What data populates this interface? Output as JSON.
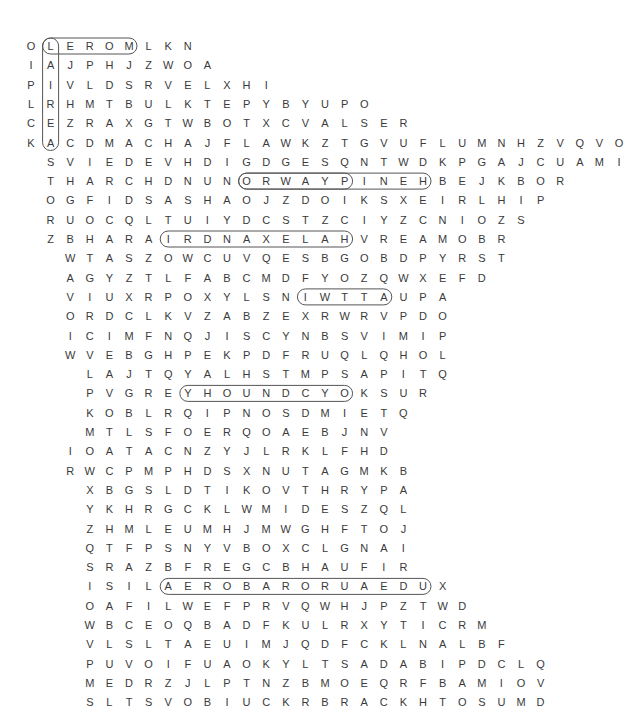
{
  "puzzle": {
    "grid_origin": {
      "x": 31,
      "y": 46
    },
    "cell_w": 19.6,
    "row_h": 19.3,
    "rows": [
      {
        "offset": 0,
        "letters": "OLEROMLKN"
      },
      {
        "offset": 0,
        "letters": "IAJPHJZWOA"
      },
      {
        "offset": 0,
        "letters": "PIVLDSRVELXHI"
      },
      {
        "offset": 0,
        "letters": "LRHMTBULKTEPYBYUPO"
      },
      {
        "offset": 0,
        "letters": "CEZRAXGTWBOTXCVALSER"
      },
      {
        "offset": 0,
        "letters": "KACDMACHAJFLAWKZTGVUFLUMNHZVQVO"
      },
      {
        "offset": 1,
        "letters": "SVIEDEVHDIGDGESQNTWDKPGAJCUAMI"
      },
      {
        "offset": 1,
        "letters": "THARCHDNUNORWAYPINEHBEJKBOR"
      },
      {
        "offset": 1,
        "letters": "OGFIDSASHAOJZDOIKSXEIRLHIP"
      },
      {
        "offset": 1,
        "letters": "RUOCQLTUIYDCSTZCIYZCNIOZS"
      },
      {
        "offset": 1,
        "letters": "ZBHARAIRDNAXELAHVREAMOBR"
      },
      {
        "offset": 2,
        "letters": "WTASZOWCUVQESBGOBDPYRST"
      },
      {
        "offset": 2,
        "letters": "AGYZTLFABCMDFYOZQWXEFD"
      },
      {
        "offset": 2,
        "letters": "VIUXRPOXYLSNIWTTAUPA"
      },
      {
        "offset": 2,
        "letters": "ORDCLKVZABZEXRWRVPDO"
      },
      {
        "offset": 2,
        "letters": "ICIMFNQJISCYNBSVIMIP"
      },
      {
        "offset": 2,
        "letters": "WVEBGHPEKPDFRUQLQHOL"
      },
      {
        "offset": 3,
        "letters": "LAJTQYALHSTMPSAPITQ"
      },
      {
        "offset": 3,
        "letters": "PVGREYHOUNDCYOKSUR"
      },
      {
        "offset": 3,
        "letters": "KOBLRQIPNOSDMIETQ"
      },
      {
        "offset": 3,
        "letters": "MTLSFOERQOAEBJNV"
      },
      {
        "offset": 2,
        "letters": "IOATACNZYJLRKLFHD"
      },
      {
        "offset": 2,
        "letters": "RWCPMPHDSXNUTAGMKB"
      },
      {
        "offset": 3,
        "letters": "XBGSLDTIKOVTHRYPA"
      },
      {
        "offset": 3,
        "letters": "YKHRGCKLWMIDESZQL"
      },
      {
        "offset": 3,
        "letters": "ZHMLEUMHJMWGHFTOJ"
      },
      {
        "offset": 3,
        "letters": "QTFPSNYVBOXCLGNAI"
      },
      {
        "offset": 3,
        "letters": "SRAZBFREGCBHAUFIR"
      },
      {
        "offset": 3,
        "letters": "ISILAEROBARORUAEDUX"
      },
      {
        "offset": 3,
        "letters": "OAFILWEFPRVQWHJPZTWD"
      },
      {
        "offset": 3,
        "letters": "WBCEOQBADFKULRXYTICRM"
      },
      {
        "offset": 3,
        "letters": "VLSLTAEUIMJQDFCKLNALBF"
      },
      {
        "offset": 3,
        "letters": "PUVOIFUAOKYLTSADABIPDCLQ"
      },
      {
        "offset": 3,
        "letters": "MEDRZJLPTNZBMOEQRFBAMIOV"
      },
      {
        "offset": 3,
        "letters": "SLTSVOBIUCKRBRACKHTOSUMD"
      }
    ],
    "found_words": [
      {
        "word": "MOREL",
        "r1": 0,
        "c1": 5,
        "r2": 0,
        "c2": 1
      },
      {
        "word": "LAIREA",
        "r1": 0,
        "c1": 1,
        "r2": 5,
        "c2": 1
      },
      {
        "word": "NORWAY",
        "r1": 7,
        "c1": 10,
        "r2": 7,
        "c2": 15
      },
      {
        "word": "NORWAYPINE",
        "r1": 7,
        "c1": 10,
        "r2": 7,
        "c2": 19
      },
      {
        "word": "ALEXANDRIA",
        "r1": 10,
        "c1": 15,
        "r2": 10,
        "c2": 6
      },
      {
        "word": "SNIWT",
        "r1": 13,
        "c1": 12,
        "r2": 13,
        "c2": 16
      },
      {
        "word": "GREYHOUND",
        "r1": 18,
        "c1": 5,
        "r2": 18,
        "c2": 13
      },
      {
        "word": "SILAEROBAROREA",
        "r1": 28,
        "c1": 4,
        "r2": 28,
        "c2": 17
      }
    ]
  }
}
